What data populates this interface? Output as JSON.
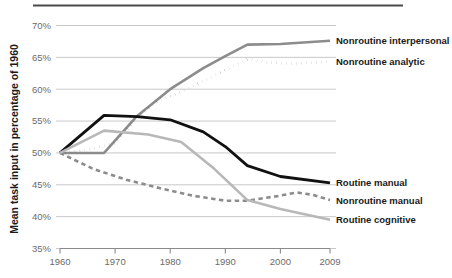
{
  "chart_data": {
    "type": "line",
    "title": "",
    "subtitle": "",
    "xlabel": "",
    "ylabel": "Mean task input in percentage of 1960",
    "xlim": [
      1959,
      2009
    ],
    "ylim": [
      35,
      70
    ],
    "grid": true,
    "grid_axis": "y",
    "legend_position": "right-inline",
    "x_ticks": [
      "1960",
      "1970",
      "1980",
      "1990",
      "2000",
      "2009"
    ],
    "x_tick_values": [
      1960,
      1970,
      1980,
      1990,
      2000,
      2009
    ],
    "y_ticks": [
      "35%",
      "40%",
      "45%",
      "50%",
      "55%",
      "60%",
      "65%",
      "70%"
    ],
    "y_tick_values": [
      35,
      40,
      45,
      50,
      55,
      60,
      65,
      70
    ],
    "series": [
      {
        "name": "Nonroutine interpersonal",
        "color": "#8c8c8c",
        "style": "solid",
        "width": 2.6,
        "x": [
          1960,
          1968,
          1974,
          1980,
          1986,
          1990,
          1994,
          2000,
          2009
        ],
        "values": [
          50.0,
          50.0,
          55.8,
          60.0,
          63.3,
          65.2,
          67.0,
          67.1,
          67.6
        ]
      },
      {
        "name": "Nonroutine analytic",
        "color": "#111111",
        "style": "dotted",
        "width": 2.8,
        "x": [
          1960,
          1965,
          1970,
          1974,
          1978,
          1982,
          1986,
          1990,
          1994,
          1998,
          2002,
          2006,
          2009
        ],
        "values": [
          50.0,
          50.5,
          51.5,
          55.5,
          58.3,
          59.6,
          61.3,
          63.0,
          64.7,
          64.2,
          64.0,
          64.2,
          64.3
        ]
      },
      {
        "name": "Routine manual",
        "color": "#111111",
        "style": "solid",
        "width": 2.8,
        "x": [
          1960,
          1968,
          1974,
          1980,
          1986,
          1990,
          1994,
          2000,
          2009
        ],
        "values": [
          50.0,
          55.9,
          55.7,
          55.2,
          53.3,
          51.0,
          48.0,
          46.3,
          45.3
        ]
      },
      {
        "name": "Nonroutine manual",
        "color": "#8c8c8c",
        "style": "dashed",
        "width": 2.6,
        "x": [
          1960,
          1966,
          1972,
          1978,
          1984,
          1990,
          1994,
          2000,
          2003,
          2006,
          2009
        ],
        "values": [
          50.0,
          47.5,
          45.8,
          44.5,
          43.3,
          42.5,
          42.5,
          43.3,
          43.8,
          43.4,
          42.6
        ]
      },
      {
        "name": "Routine cognitive",
        "color": "#b8b8b8",
        "style": "solid",
        "width": 2.6,
        "x": [
          1960,
          1968,
          1976,
          1982,
          1988,
          1994,
          2000,
          2009
        ],
        "values": [
          50.0,
          53.5,
          52.9,
          51.7,
          47.5,
          42.6,
          41.2,
          39.5
        ]
      }
    ],
    "annotations": [
      {
        "label": "Nonroutine interpersonal",
        "series": "Nonroutine interpersonal",
        "at_y": 67.6
      },
      {
        "label": "Nonroutine analytic",
        "series": "Nonroutine analytic",
        "at_y": 64.3
      },
      {
        "label": "Routine manual",
        "series": "Routine manual",
        "at_y": 45.3
      },
      {
        "label": "Nonroutine manual",
        "series": "Nonroutine manual",
        "at_y": 42.6
      },
      {
        "label": "Routine cognitive",
        "series": "Routine cognitive",
        "at_y": 39.5
      }
    ]
  },
  "colors": {
    "grid": "#c2c2c2",
    "axis": "#8a8a8a",
    "top_rule": "#4a4a4a",
    "tick_label": "#6b6b6b",
    "text": "#1a1a1a",
    "background": "#ffffff"
  }
}
